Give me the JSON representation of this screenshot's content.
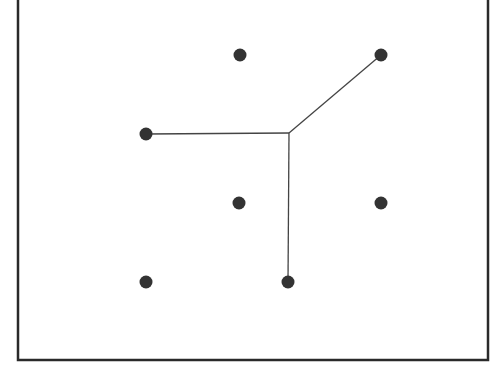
{
  "diagram": {
    "type": "steiner-tree",
    "frame": {
      "x": 18,
      "y": -10,
      "width": 470,
      "height": 370,
      "stroke": "#2a2a2a"
    },
    "colors": {
      "node": "#333333",
      "edge": "#444444",
      "background": "#ffffff"
    },
    "junction": {
      "x": 289,
      "y": 133
    },
    "nodes": [
      {
        "id": "n1",
        "x": 240,
        "y": 55,
        "connected": false
      },
      {
        "id": "n2",
        "x": 381,
        "y": 55,
        "connected": true
      },
      {
        "id": "n3",
        "x": 146,
        "y": 134,
        "connected": true
      },
      {
        "id": "n4",
        "x": 239,
        "y": 203,
        "connected": false
      },
      {
        "id": "n5",
        "x": 381,
        "y": 203,
        "connected": false
      },
      {
        "id": "n6",
        "x": 146,
        "y": 282,
        "connected": false
      },
      {
        "id": "n7",
        "x": 288,
        "y": 282,
        "connected": true
      }
    ],
    "edges": [
      {
        "from": "junction",
        "to": "n2"
      },
      {
        "from": "junction",
        "to": "n3"
      },
      {
        "from": "junction",
        "to": "n7"
      }
    ]
  }
}
